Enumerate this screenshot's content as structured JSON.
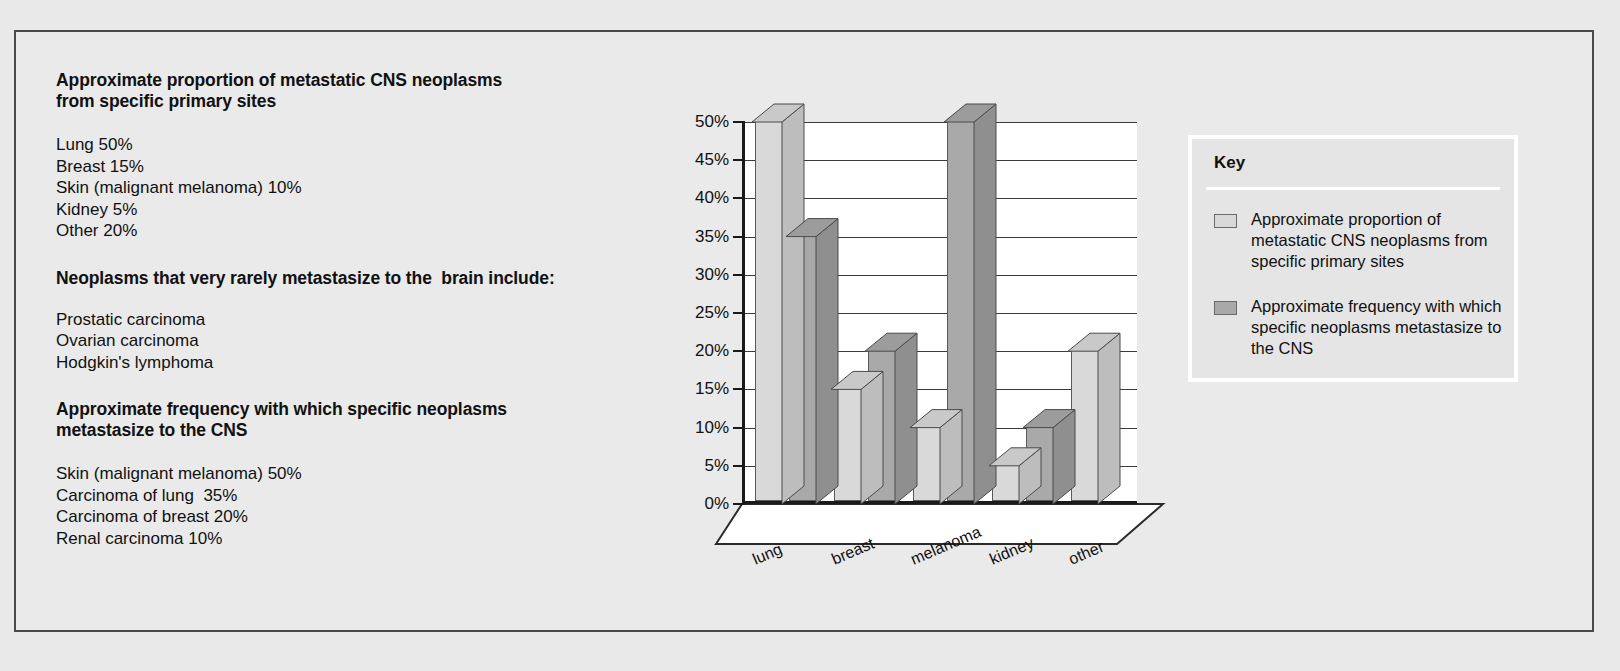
{
  "panel": {
    "sections": [
      {
        "heading": "Approximate proportion of metastatic CNS neoplasms\nfrom specific primary sites",
        "lines": [
          "Lung 50%",
          "Breast 15%",
          "Skin (malignant melanoma) 10%",
          "Kidney 5%",
          "Other 20%"
        ]
      },
      {
        "heading": "Neoplasms that very rarely metastasize to the  brain include:",
        "lines": [
          "Prostatic carcinoma",
          "Ovarian carcinoma",
          "Hodgkin's lymphoma"
        ]
      },
      {
        "heading": "Approximate frequency with which specific neoplasms\nmetastasize to the CNS",
        "lines": [
          "Skin (malignant melanoma) 50%",
          "Carcinoma of lung  35%",
          "Carcinoma of breast 20%",
          "Renal carcinoma 10%"
        ]
      }
    ]
  },
  "key": {
    "title": "Key",
    "items": [
      {
        "color": "#d9d9d9",
        "label": "Approximate proportion of metastatic CNS neoplasms from specific primary sites"
      },
      {
        "color": "#a9a9a9",
        "label": "Approximate frequency with which specific neoplasms metastasize to the CNS"
      }
    ]
  },
  "chart_data": {
    "type": "bar",
    "title": "",
    "xlabel": "",
    "ylabel": "",
    "ylim": [
      0,
      50
    ],
    "ytick_labels": [
      "0%",
      "5%",
      "10%",
      "15%",
      "20%",
      "25%",
      "30%",
      "35%",
      "40%",
      "45%",
      "50%"
    ],
    "yticks": [
      0,
      5,
      10,
      15,
      20,
      25,
      30,
      35,
      40,
      45,
      50
    ],
    "grid": true,
    "legend_position": "right",
    "three_d": true,
    "categories": [
      "lung",
      "breast",
      "melanoma",
      "kidney",
      "other"
    ],
    "series": [
      {
        "name": "Approximate proportion of metastatic CNS neoplasms from specific primary sites",
        "color": "#d9d9d9",
        "values": [
          50,
          15,
          10,
          5,
          20
        ]
      },
      {
        "name": "Approximate frequency with which specific neoplasms metastasize to the CNS",
        "color": "#a9a9a9",
        "values": [
          35,
          20,
          50,
          10,
          null
        ]
      }
    ]
  }
}
